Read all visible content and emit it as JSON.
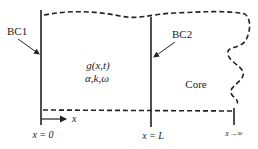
{
  "labels": {
    "bc1": "BC1",
    "bc2": "BC2",
    "function": "g(x,t)",
    "params": "α,k,ω",
    "core": "Core",
    "axis": "x",
    "x0": "x = 0",
    "xL": "x = L",
    "xinf": "x→∞"
  },
  "colors": {
    "stroke": "#222222",
    "background": "#ffffff"
  }
}
